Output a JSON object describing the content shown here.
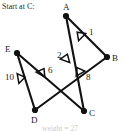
{
  "caption": {
    "start_text": "Start at C:",
    "footer_text": "weight = 27"
  },
  "graph": {
    "nodes": [
      {
        "id": "A",
        "label": "A",
        "x": 66,
        "y": 16,
        "label_x": 63,
        "label_y": 10
      },
      {
        "id": "B",
        "label": "B",
        "x": 107,
        "y": 57,
        "label_x": 112,
        "label_y": 61
      },
      {
        "id": "C",
        "label": "C",
        "x": 84,
        "y": 111,
        "label_x": 89,
        "label_y": 116
      },
      {
        "id": "D",
        "label": "D",
        "x": 35,
        "y": 110,
        "label_x": 31,
        "label_y": 123
      },
      {
        "id": "E",
        "label": "E",
        "x": 17,
        "y": 53,
        "label_x": 5,
        "label_y": 52
      }
    ],
    "edges": [
      {
        "id": "A-B",
        "from": "A",
        "to": "B",
        "weight": "1",
        "label_x": 89,
        "label_y": 35
      },
      {
        "id": "A-C",
        "from": "A",
        "to": "C",
        "weight": "2",
        "label_x": 57,
        "label_y": 58
      },
      {
        "id": "D-B",
        "from": "D",
        "to": "B",
        "weight": "8",
        "label_x": 86,
        "label_y": 80
      },
      {
        "id": "E-C",
        "from": "E",
        "to": "C",
        "weight": "6",
        "label_x": 48,
        "label_y": 73
      },
      {
        "id": "E-D",
        "from": "E",
        "to": "D",
        "weight": "10",
        "label_x": 5,
        "label_y": 80
      }
    ],
    "arrow_markers": [
      {
        "id": "marker-A-B",
        "x": 80,
        "y": 35,
        "rotation": -45
      },
      {
        "id": "marker-A-C",
        "x": 66,
        "y": 58,
        "rotation": 20
      },
      {
        "id": "marker-D-B",
        "x": 79,
        "y": 71,
        "rotation": -30
      },
      {
        "id": "marker-E-C",
        "x": 42,
        "y": 72,
        "rotation": 30
      },
      {
        "id": "marker-E-D",
        "x": 21,
        "y": 78,
        "rotation": 80
      }
    ],
    "colors": {
      "stroke": "#111111",
      "node_fill": "#111111",
      "text": "#1a1a1a",
      "background": "#ffffff"
    }
  }
}
